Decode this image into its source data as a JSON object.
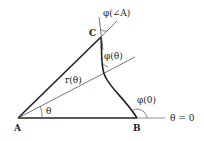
{
  "diagram": {
    "points": {
      "A": "A",
      "B": "B",
      "C": "C"
    },
    "labels": {
      "phi_angle_A": "φ(∠A)",
      "phi_theta": "φ(θ)",
      "phi_zero": "φ(0)",
      "r_theta": "r(θ)",
      "theta": "θ",
      "theta_zero": "θ = 0"
    },
    "colors": {
      "stroke": "#222222",
      "thin": "#555555"
    }
  }
}
